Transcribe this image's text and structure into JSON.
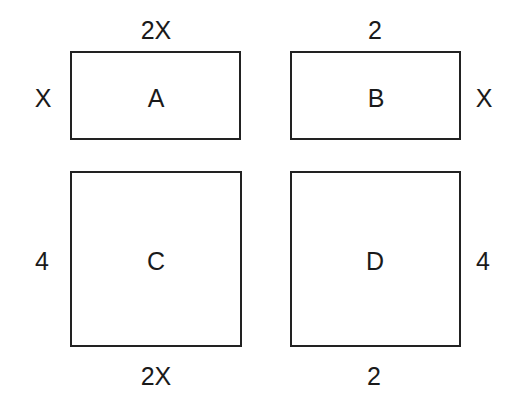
{
  "diagram": {
    "rectangles": [
      {
        "name": "A",
        "label": "A",
        "top": "2X",
        "left": "X"
      },
      {
        "name": "B",
        "label": "B",
        "top": "2",
        "right": "X"
      },
      {
        "name": "C",
        "label": "C",
        "left": "4",
        "bottom": "2X"
      },
      {
        "name": "D",
        "label": "D",
        "right": "4",
        "bottom": "2"
      }
    ]
  }
}
